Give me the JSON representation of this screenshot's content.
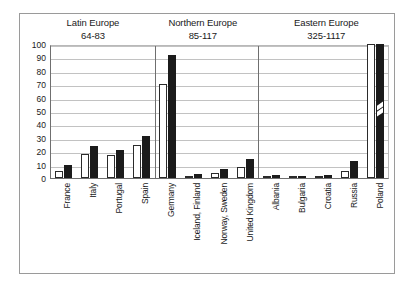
{
  "chart_data": {
    "type": "bar",
    "title": "",
    "xlabel": "",
    "ylabel": "",
    "ylim": [
      0,
      100
    ],
    "yticks": [
      0,
      10,
      20,
      30,
      40,
      50,
      60,
      70,
      80,
      90,
      100
    ],
    "grid": true,
    "legend": "none",
    "categories": [
      "France",
      "Italy",
      "Portugal",
      "Spain",
      "Germany",
      "Iceland, Finland",
      "Norway, Sweden",
      "United Kingdom",
      "Albania",
      "Bulgaria",
      "Croatia",
      "Russia",
      "Poland"
    ],
    "series": [
      {
        "name": "series-white",
        "style": "open",
        "values": [
          5,
          18,
          17,
          25,
          70,
          1,
          4,
          8,
          1,
          0.5,
          0.5,
          5,
          100
        ]
      },
      {
        "name": "series-black",
        "style": "filled",
        "values": [
          10,
          24,
          21,
          31,
          92,
          3,
          7,
          14,
          2,
          1,
          2,
          13,
          100
        ]
      }
    ],
    "broken_axis_categories": [
      "Poland"
    ],
    "groups": [
      {
        "name": "Latin Europe",
        "range": "64-83",
        "categories": [
          "France",
          "Italy",
          "Portugal",
          "Spain"
        ]
      },
      {
        "name": "Northern Europe",
        "range": "85-117",
        "categories": [
          "Germany",
          "Iceland, Finland",
          "Norway, Sweden",
          "United Kingdom"
        ]
      },
      {
        "name": "Eastern Europe",
        "range": "325-1117",
        "categories": [
          "Albania",
          "Bulgaria",
          "Croatia",
          "Russia",
          "Poland"
        ]
      }
    ]
  },
  "colors": {
    "series_white_fill": "#ffffff",
    "series_white_edge": "#2b2b2b",
    "series_black_fill": "#1b1b1b",
    "gridline": "#c2c2c2",
    "axis": "#6f6f6f",
    "frame": "#9a9a9a",
    "text": "#1a1a1a",
    "background": "#ffffff"
  }
}
